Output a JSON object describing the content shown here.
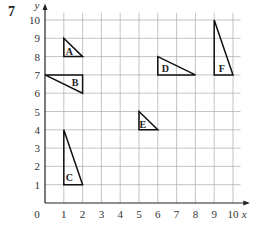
{
  "question_number": "7",
  "axes": {
    "x_label": "x",
    "y_label": "y",
    "origin_label": "0"
  },
  "chart_data": {
    "type": "diagram",
    "title": "",
    "xlabel": "x",
    "ylabel": "y",
    "xlim": [
      0,
      10
    ],
    "ylim": [
      0,
      10
    ],
    "x_ticks": [
      1,
      2,
      3,
      4,
      5,
      6,
      7,
      8,
      9,
      10
    ],
    "y_ticks": [
      1,
      2,
      3,
      4,
      5,
      6,
      7,
      8,
      9,
      10
    ],
    "grid": true,
    "shapes": [
      {
        "name": "A",
        "vertices": [
          [
            1,
            9
          ],
          [
            1,
            8
          ],
          [
            2,
            8
          ]
        ],
        "label_pos": [
          1.3,
          8.3
        ]
      },
      {
        "name": "B",
        "vertices": [
          [
            0,
            7
          ],
          [
            2,
            7
          ],
          [
            2,
            6
          ]
        ],
        "label_pos": [
          1.6,
          6.6
        ]
      },
      {
        "name": "C",
        "vertices": [
          [
            1,
            4
          ],
          [
            1,
            1
          ],
          [
            2,
            1
          ]
        ],
        "label_pos": [
          1.3,
          1.4
        ]
      },
      {
        "name": "D",
        "vertices": [
          [
            6,
            8
          ],
          [
            6,
            7
          ],
          [
            8,
            7
          ]
        ],
        "label_pos": [
          6.4,
          7.4
        ]
      },
      {
        "name": "E",
        "vertices": [
          [
            5,
            5
          ],
          [
            5,
            4
          ],
          [
            6,
            4
          ]
        ],
        "label_pos": [
          5.2,
          4.3
        ]
      },
      {
        "name": "F",
        "vertices": [
          [
            9,
            10
          ],
          [
            9,
            7
          ],
          [
            10,
            7
          ]
        ],
        "label_pos": [
          9.4,
          7.4
        ]
      }
    ]
  }
}
